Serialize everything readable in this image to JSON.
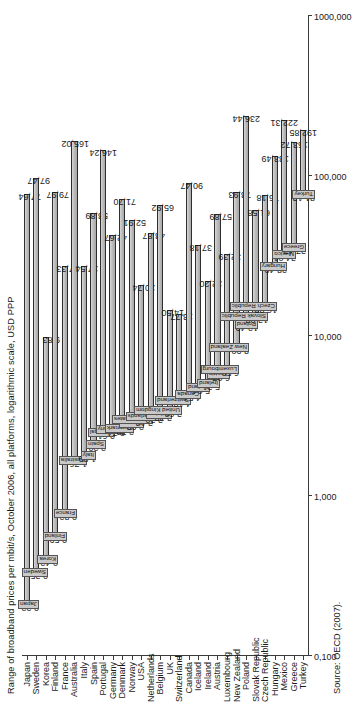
{
  "chart_data": {
    "type": "bar",
    "title": "Range of broadband prices per mbit/s, October 2006,  all platforms, logarithmic scale, USD PPP",
    "source": "Source: OECD (2007).",
    "xlabel": "",
    "ylabel": "",
    "scale": "log",
    "grid": false,
    "legend": "none",
    "axis_ticks": [
      "0,100",
      "1,000",
      "10,000",
      "100,000",
      "1000,000"
    ],
    "axis_tick_values": [
      0.1,
      1,
      10,
      100,
      1000
    ],
    "xlim": [
      0.1,
      1000
    ],
    "categories": [
      "Japan",
      "Sweden",
      "Korea",
      "Finland",
      "France",
      "Australia",
      "Italy",
      "Spain",
      "Portugal",
      "Germany",
      "Denmark",
      "Norway",
      "USA",
      "Netherlands",
      "Belgium",
      "UK",
      "Switzerland",
      "Canada",
      "Iceland",
      "Ireland",
      "Austria",
      "Luxembourg",
      "New Zealand",
      "Poland",
      "Slovak Republic",
      "Czech Republic",
      "Hungary",
      "Mexico",
      "Greece",
      "Turkey"
    ],
    "series": [
      {
        "name": "Minimum price",
        "values": [
          0.22,
          0.35,
          0.42,
          0.59,
          0.82,
          1.76,
          1.89,
          2.2,
          2.61,
          2.74,
          2.78,
          2.98,
          3.18,
          3.3,
          3.38,
          3.62,
          4.18,
          4.54,
          5.04,
          5.31,
          6.07,
          6.5,
          8.9,
          12.49,
          13.98,
          16.03,
          28.49,
          34.01,
          37.47,
          81.13
        ]
      },
      {
        "name": "Maximum price",
        "values": [
          77.64,
          97.47,
          9.83,
          79.97,
          27.33,
          165.02,
          27.54,
          58.89,
          146.24,
          42.67,
          71.7,
          52.91,
          20.74,
          43.87,
          65.92,
          14.5,
          13.77,
          90.47,
          37.18,
          22.2,
          57.89,
          32.39,
          78.93,
          61.58,
          76.18,
          133.49,
          222.31,
          163.72,
          192.85,
          192.85
        ]
      },
      {
        "name": "Maximum price corrected",
        "values": [
          77.64,
          97.47,
          9.83,
          79.97,
          27.33,
          165.02,
          27.54,
          58.89,
          146.24,
          42.67,
          71.7,
          52.91,
          20.74,
          43.87,
          65.92,
          14.5,
          13.77,
          90.47,
          37.18,
          22.2,
          57.89,
          32.39,
          78.93,
          61.58,
          76.18,
          133.49,
          236.44,
          222.31,
          163.72,
          192.85
        ]
      }
    ],
    "bars": [
      {
        "country": "Japan",
        "min": 0.22,
        "max": 77.64,
        "min_label": "0,22",
        "max_label": "77,64"
      },
      {
        "country": "Sweden",
        "min": 0.35,
        "max": 97.47,
        "min_label": "0,35",
        "max_label": "97,47"
      },
      {
        "country": "Korea",
        "min": 0.42,
        "max": 9.83,
        "min_label": "0,42",
        "max_label": "9,83"
      },
      {
        "country": "Finland",
        "min": 0.59,
        "max": 79.97,
        "min_label": "0,59",
        "max_label": "79,97"
      },
      {
        "country": "France",
        "min": 0.82,
        "max": 27.33,
        "min_label": "0,82",
        "max_label": "27,33"
      },
      {
        "country": "Australia",
        "min": 1.76,
        "max": 165.02,
        "min_label": "1,76",
        "max_label": "165,02"
      },
      {
        "country": "Italy",
        "min": 1.89,
        "max": 27.54,
        "min_label": "1,89",
        "max_label": "27,54"
      },
      {
        "country": "Spain",
        "min": 2.2,
        "max": 58.89,
        "min_label": "2,20",
        "max_label": "58,89"
      },
      {
        "country": "Portugal",
        "min": 2.61,
        "max": 146.24,
        "min_label": "2,61",
        "max_label": "146,24"
      },
      {
        "country": "Germany",
        "min": 2.74,
        "max": 42.67,
        "min_label": "2,74",
        "max_label": "42,67"
      },
      {
        "country": "Denmark",
        "min": 2.78,
        "max": 71.7,
        "min_label": "2,78",
        "max_label": "71,70"
      },
      {
        "country": "Norway",
        "min": 2.98,
        "max": 52.91,
        "min_label": "2,98",
        "max_label": "52,91"
      },
      {
        "country": "United States",
        "min": 3.18,
        "max": 20.74,
        "min_label": "3,18",
        "max_label": "20,74"
      },
      {
        "country": "Netherlands",
        "min": 3.3,
        "max": 43.87,
        "min_label": "3,30",
        "max_label": "43,87"
      },
      {
        "country": "Belgium",
        "min": 3.38,
        "max": 65.92,
        "min_label": "3,38",
        "max_label": "65,92"
      },
      {
        "country": "United Kingdom",
        "min": 3.62,
        "max": 14.5,
        "min_label": "3,62",
        "max_label": "14,50"
      },
      {
        "country": "Switzerland",
        "min": 4.18,
        "max": 13.77,
        "min_label": "4,18",
        "max_label": "13,77"
      },
      {
        "country": "Canada",
        "min": 4.54,
        "max": 90.47,
        "min_label": "4,54",
        "max_label": "90,47"
      },
      {
        "country": "Iceland",
        "min": 5.04,
        "max": 37.18,
        "min_label": "5,04",
        "max_label": "37,18"
      },
      {
        "country": "Ireland",
        "min": 5.31,
        "max": 22.2,
        "min_label": "5,31",
        "max_label": "22,20"
      },
      {
        "country": "Austria",
        "min": 6.07,
        "max": 57.89,
        "min_label": "6,07",
        "max_label": "57,89"
      },
      {
        "country": "Luxembourg",
        "min": 6.5,
        "max": 32.39,
        "min_label": "6,50",
        "max_label": "32,39"
      },
      {
        "country": "New Zealand",
        "min": 8.9,
        "max": 78.93,
        "min_label": "8,90",
        "max_label": "78,93"
      },
      {
        "country": "Poland",
        "min": 12.49,
        "max": 236.44,
        "min_label": "12,49",
        "max_label": "236,44"
      },
      {
        "country": "Slovak Republic",
        "min": 13.98,
        "max": 61.58,
        "min_label": "13,98",
        "max_label": "61,58"
      },
      {
        "country": "Czech Republic",
        "min": 16.03,
        "max": 76.18,
        "min_label": "16,03",
        "max_label": "76,18"
      },
      {
        "country": "Hungary",
        "min": 28.49,
        "max": 133.49,
        "min_label": "28,49",
        "max_label": "133,49"
      },
      {
        "country": "Mexico",
        "min": 34.01,
        "max": 222.31,
        "min_label": "34,01",
        "max_label": "222,31"
      },
      {
        "country": "Greece",
        "min": 37.47,
        "max": 163.72,
        "min_label": "37,47",
        "max_label": "163,72"
      },
      {
        "country": "Turkey",
        "min": 81.13,
        "max": 192.85,
        "min_label": "81,13",
        "max_label": "192,85"
      }
    ]
  }
}
